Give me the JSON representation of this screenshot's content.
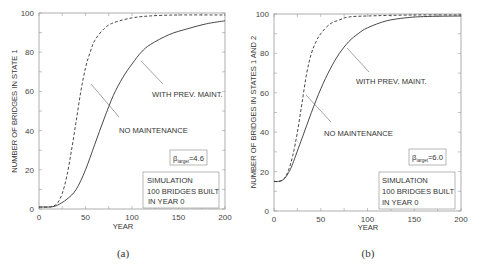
{
  "chart_data": [
    {
      "type": "line",
      "panel": "(a)",
      "xlabel": "YEAR",
      "ylabel": "NUMBER OF BRIDGES IN STATE 1",
      "xlim": [
        0,
        200
      ],
      "ylim": [
        0,
        100
      ],
      "xticks": [
        0,
        50,
        100,
        150,
        200
      ],
      "yticks": [
        0,
        20,
        40,
        60,
        80,
        100
      ],
      "grid": false,
      "series": [
        {
          "name": "NO MAINTENANCE",
          "style": "dashed",
          "x": [
            0,
            10,
            15,
            20,
            25,
            30,
            35,
            40,
            45,
            50,
            55,
            60,
            70,
            80,
            100,
            120,
            150,
            200
          ],
          "y": [
            1,
            1,
            1.5,
            3,
            8,
            17,
            30,
            45,
            60,
            72,
            80,
            86,
            92,
            95,
            97.5,
            98.5,
            99,
            99
          ]
        },
        {
          "name": "WITH PREV. MAINT.",
          "style": "solid",
          "x": [
            0,
            10,
            15,
            20,
            30,
            40,
            50,
            60,
            70,
            80,
            90,
            100,
            110,
            120,
            140,
            160,
            180,
            200
          ],
          "y": [
            1,
            1,
            1.2,
            2,
            5,
            10,
            20,
            33,
            46,
            58,
            67,
            74,
            80,
            84,
            89,
            92,
            94.5,
            96
          ]
        }
      ],
      "annotations": [
        {
          "text": "NO MAINTENANCE",
          "points_to": "dashed"
        },
        {
          "text": "WITH PREV. MAINT.",
          "points_to": "solid"
        },
        {
          "text": "β_target=4.6"
        },
        {
          "text": "SIMULATION 100 BRIDGES BUILT IN YEAR 0"
        }
      ]
    },
    {
      "type": "line",
      "panel": "(b)",
      "xlabel": "YEAR",
      "ylabel": "NUMBER OF BRIDGES IN STATES 1 AND 2",
      "xlim": [
        0,
        200
      ],
      "ylim": [
        0,
        100
      ],
      "xticks": [
        0,
        50,
        100,
        150,
        200
      ],
      "yticks": [
        0,
        20,
        40,
        60,
        80,
        100
      ],
      "grid": false,
      "series": [
        {
          "name": "NO MAINTENANCE",
          "style": "dashed",
          "x": [
            0,
            5,
            10,
            15,
            20,
            25,
            30,
            35,
            40,
            45,
            50,
            60,
            70,
            80,
            100,
            150,
            200
          ],
          "y": [
            15,
            15,
            16,
            20,
            28,
            40,
            55,
            70,
            80,
            86,
            90,
            95,
            97,
            98.5,
            99,
            99.5,
            99.5
          ]
        },
        {
          "name": "WITH PREV. MAINT.",
          "style": "solid",
          "x": [
            0,
            5,
            10,
            15,
            20,
            30,
            40,
            50,
            60,
            70,
            80,
            90,
            100,
            120,
            140,
            160,
            200
          ],
          "y": [
            15,
            15,
            16,
            19,
            24,
            37,
            50,
            62,
            72,
            80,
            86,
            90,
            93,
            96.5,
            98,
            98.7,
            99
          ]
        }
      ],
      "annotations": [
        {
          "text": "NO MAINTENANCE",
          "points_to": "dashed"
        },
        {
          "text": "WITH PREV. MAINT.",
          "points_to": "solid"
        },
        {
          "text": "β_target=6.0"
        },
        {
          "text": "SIMULATION 100 BRIDGES BUILT IN YEAR 0"
        }
      ]
    }
  ],
  "panels": {
    "a": {
      "caption": "(a)",
      "xlabel": "YEAR",
      "ylabel": "NUMBER OF BRIDGES IN STATE 1",
      "xticks": [
        "0",
        "50",
        "100",
        "150",
        "200"
      ],
      "yticks": [
        "0",
        "20",
        "40",
        "60",
        "80",
        "100"
      ],
      "label_no_maint": "NO MAINTENANCE",
      "label_prev_maint": "WITH PREV. MAINT.",
      "beta_symbol": "β",
      "beta_sub": "target",
      "beta_value": "=4.6",
      "sim_line1": "SIMULATION",
      "sim_line2": "100 BRIDGES BUILT",
      "sim_line3": "IN YEAR 0"
    },
    "b": {
      "caption": "(b)",
      "xlabel": "YEAR",
      "ylabel": "NUMBER OF BRIDGES IN STATES 1 AND 2",
      "xticks": [
        "0",
        "50",
        "100",
        "150",
        "200"
      ],
      "yticks": [
        "0",
        "20",
        "40",
        "60",
        "80",
        "100"
      ],
      "label_no_maint": "NO MAINTENANCE",
      "label_prev_maint": "WITH PREV. MAINT.",
      "beta_symbol": "β",
      "beta_sub": "target",
      "beta_value": "=6.0",
      "sim_line1": "SIMULATION",
      "sim_line2": "100 BRIDGES BUILT",
      "sim_line3": "IN YEAR 0"
    }
  },
  "colors": {
    "axis": "#9a9a9a",
    "curve": "#333333",
    "text": "#333333"
  }
}
